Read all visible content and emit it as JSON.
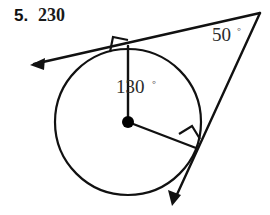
{
  "header": {
    "problem_number": "5.",
    "answer_value": "230"
  },
  "figure": {
    "type": "circle-two-tangents",
    "circle": {
      "center_x": 128,
      "center_y": 122,
      "radius": 73,
      "stroke_color": "#111111"
    },
    "center_point": {
      "name": "circle-center-dot",
      "x": 128,
      "y": 122,
      "radius": 6,
      "fill_color": "#000000"
    },
    "external_vertex": {
      "x": 260,
      "y": 13
    },
    "tangent_points": [
      {
        "name": "upper-tangent-point",
        "x": 128,
        "y": 46
      },
      {
        "name": "lower-tangent-point",
        "x": 196,
        "y": 148
      }
    ],
    "arrow_tips": [
      {
        "name": "upper-tangent-arrow-tip",
        "x": 30,
        "y": 65
      },
      {
        "name": "lower-tangent-arrow-tip",
        "x": 172,
        "y": 205
      }
    ],
    "right_angle_marks": [
      {
        "name": "upper-right-angle-mark",
        "measure": "90"
      },
      {
        "name": "lower-right-angle-mark",
        "measure": "90"
      }
    ],
    "labels": {
      "vertex_angle": "50",
      "vertex_angle_degree_symbol": "◦",
      "central_angle": "130",
      "central_angle_degree_symbol": "◦"
    },
    "colors": {
      "ink": "#111111",
      "label_ink": "#2b2b2b",
      "background": "#ffffff"
    }
  }
}
